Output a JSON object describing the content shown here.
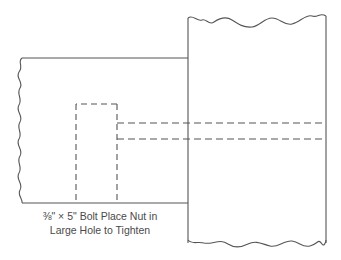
{
  "diagram": {
    "caption": {
      "line1": "⅜\" × 5\" Bolt Place Nut in",
      "line2": "Large Hole to Tighten"
    },
    "components": [
      {
        "name": "beam",
        "style": "solid",
        "broken_edge": "left"
      },
      {
        "name": "post",
        "style": "solid",
        "broken_edges": [
          "top",
          "bottom"
        ]
      },
      {
        "name": "large-hole",
        "style": "dashed"
      },
      {
        "name": "bolt",
        "style": "dashed",
        "count_lines": 2
      }
    ],
    "colors": {
      "line": "#555555",
      "background": "#ffffff",
      "text": "#4a4a4a"
    }
  }
}
